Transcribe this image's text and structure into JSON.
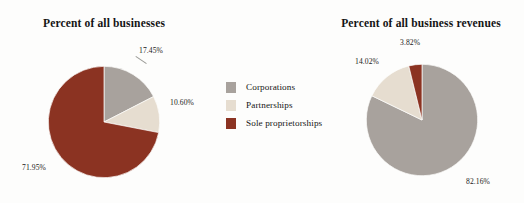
{
  "page": {
    "background_color": "#fdfdfc",
    "width": 524,
    "height": 203
  },
  "palette": {
    "corporations": "#a8a29d",
    "partnerships": "#e6ddd0",
    "sole_proprietorships": "#8b3322",
    "label_text": "#1a1a1a",
    "title_text": "#141414",
    "leader_line": "#9a9a96"
  },
  "legend": {
    "position": "center",
    "items": [
      {
        "label": "Corporations",
        "color": "#a8a29d",
        "swatch_name": "legend-swatch-corporations"
      },
      {
        "label": "Partnerships",
        "color": "#e6ddd0",
        "swatch_name": "legend-swatch-partnerships"
      },
      {
        "label": "Sole proprietorships",
        "color": "#8b3322",
        "swatch_name": "legend-swatch-sole-proprietorships"
      }
    ]
  },
  "chart_data": [
    {
      "type": "pie",
      "id": "businesses",
      "title": "Percent of all businesses",
      "xlabel": "",
      "ylabel": "",
      "start_angle_deg": 0,
      "direction": "clockwise",
      "categories": [
        "Corporations",
        "Partnerships",
        "Sole proprietorships"
      ],
      "values": [
        17.45,
        10.6,
        71.95
      ],
      "labels": [
        "17.45%",
        "10.60%",
        "71.95%"
      ],
      "colors": [
        "#a8a29d",
        "#e6ddd0",
        "#8b3322"
      ],
      "units": "percent"
    },
    {
      "type": "pie",
      "id": "business-revenues",
      "title": "Percent of all business revenues",
      "xlabel": "",
      "ylabel": "",
      "start_angle_deg": 0,
      "direction": "clockwise",
      "categories": [
        "Corporations",
        "Partnerships",
        "Sole proprietorships"
      ],
      "values": [
        82.16,
        14.02,
        3.82
      ],
      "labels": [
        "82.16%",
        "14.02%",
        "3.82%"
      ],
      "colors": [
        "#a8a29d",
        "#e6ddd0",
        "#8b3322"
      ],
      "units": "percent"
    }
  ]
}
